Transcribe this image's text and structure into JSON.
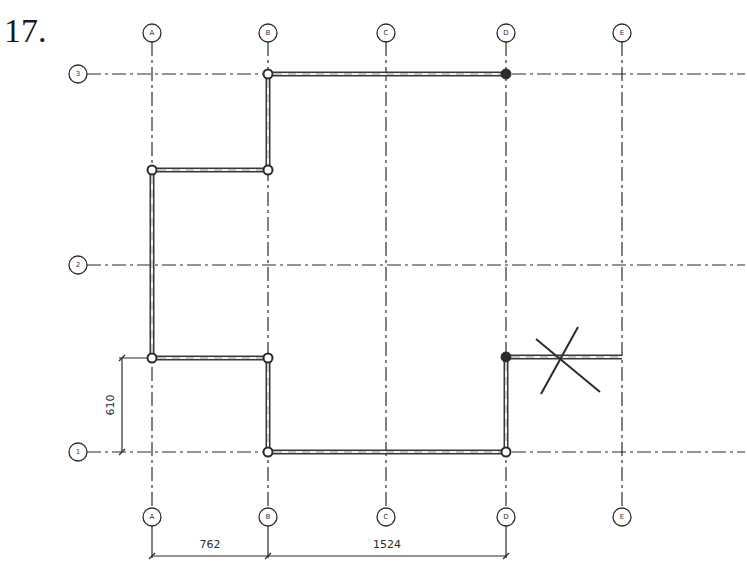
{
  "problem": {
    "number": "17."
  },
  "grid": {
    "columns": [
      {
        "label": "A",
        "x": 152
      },
      {
        "label": "B",
        "x": 268
      },
      {
        "label": "C",
        "x": 386
      },
      {
        "label": "D",
        "x": 506
      },
      {
        "label": "E",
        "x": 622
      }
    ],
    "rows": [
      {
        "label": "3",
        "y": 74
      },
      {
        "label": "2",
        "y": 265
      },
      {
        "label": "1",
        "y": 452
      }
    ],
    "top_bubble_y": 33,
    "bottom_bubble_y": 517,
    "left_bubble_x": 78
  },
  "dimensions": {
    "horizontal": [
      {
        "label": "762",
        "from": "A",
        "to": "B"
      },
      {
        "label": "1524",
        "from": "B",
        "to": "D"
      }
    ],
    "vertical": [
      {
        "label": "610",
        "from_y": 358,
        "to_y": 452
      }
    ]
  },
  "walls": [
    {
      "x1": 268,
      "y1": 74,
      "x2": 506,
      "y2": 74
    },
    {
      "x1": 268,
      "y1": 74,
      "x2": 268,
      "y2": 170
    },
    {
      "x1": 152,
      "y1": 170,
      "x2": 268,
      "y2": 170
    },
    {
      "x1": 152,
      "y1": 170,
      "x2": 152,
      "y2": 358
    },
    {
      "x1": 152,
      "y1": 358,
      "x2": 268,
      "y2": 358
    },
    {
      "x1": 268,
      "y1": 358,
      "x2": 268,
      "y2": 452
    },
    {
      "x1": 268,
      "y1": 452,
      "x2": 506,
      "y2": 452
    },
    {
      "x1": 506,
      "y1": 357,
      "x2": 506,
      "y2": 452
    },
    {
      "x1": 506,
      "y1": 357,
      "x2": 622,
      "y2": 357
    }
  ],
  "nodes": [
    {
      "x": 268,
      "y": 74,
      "style": "open"
    },
    {
      "x": 506,
      "y": 74,
      "style": "solid"
    },
    {
      "x": 152,
      "y": 170,
      "style": "open"
    },
    {
      "x": 268,
      "y": 170,
      "style": "open"
    },
    {
      "x": 152,
      "y": 358,
      "style": "open"
    },
    {
      "x": 268,
      "y": 358,
      "style": "open"
    },
    {
      "x": 268,
      "y": 452,
      "style": "open"
    },
    {
      "x": 506,
      "y": 452,
      "style": "open"
    },
    {
      "x": 506,
      "y": 357,
      "style": "solid"
    }
  ],
  "cross_marker": {
    "line1": {
      "x1": 536,
      "y1": 339,
      "x2": 600,
      "y2": 392
    },
    "line2": {
      "x1": 578,
      "y1": 327,
      "x2": 541,
      "y2": 394
    }
  },
  "colors": {
    "ink": "#2b2b2b",
    "background": "#ffffff"
  }
}
